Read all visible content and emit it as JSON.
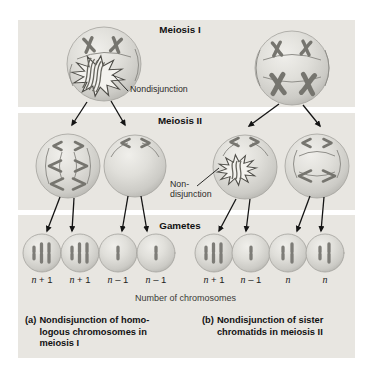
{
  "figure": {
    "sections": {
      "meiosis1_title": "Meiosis I",
      "meiosis2_title": "Meiosis II",
      "gametes_title": "Gametes"
    },
    "annotations": {
      "nondisjunction_meiosis1": "Nondisjunction",
      "nondisjunction_meiosis2_line1": "Non-",
      "nondisjunction_meiosis2_line2": "disjunction",
      "axis_label": "Number of chromosomes"
    },
    "gametes": {
      "items": [
        {
          "label_n": "n",
          "label_suffix": " + 1",
          "chromosomes_shown": 3
        },
        {
          "label_n": "n",
          "label_suffix": " + 1",
          "chromosomes_shown": 3
        },
        {
          "label_n": "n",
          "label_suffix": " – 1",
          "chromosomes_shown": 1
        },
        {
          "label_n": "n",
          "label_suffix": " – 1",
          "chromosomes_shown": 1
        },
        {
          "label_n": "n",
          "label_suffix": " + 1",
          "chromosomes_shown": 3
        },
        {
          "label_n": "n",
          "label_suffix": " – 1",
          "chromosomes_shown": 1
        },
        {
          "label_n": "n",
          "label_suffix": "",
          "chromosomes_shown": 2
        },
        {
          "label_n": "n",
          "label_suffix": "",
          "chromosomes_shown": 2
        }
      ]
    },
    "captions": {
      "a": {
        "tag": "(a)",
        "lines": [
          "Nondisjunction of homo-",
          "logous chromosomes in",
          "meiosis I"
        ]
      },
      "b": {
        "tag": "(b)",
        "lines": [
          "Nondisjunction of sister",
          "chromatids in meiosis II"
        ]
      }
    },
    "colors": {
      "band_background": "#e8e6e1",
      "cell_fill_light": "#f0efeb",
      "cell_fill_dark": "#b4b3ae",
      "chromosome": "#76756f",
      "arrow": "#141414",
      "starburst_fill": "#f3f2ee"
    }
  }
}
